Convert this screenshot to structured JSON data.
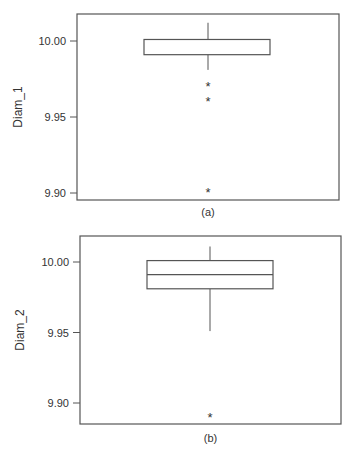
{
  "chart_data": [
    {
      "type": "box",
      "title": "",
      "caption": "(a)",
      "xlabel": "",
      "ylabel": "Diam_1",
      "ylim": [
        9.893,
        10.016
      ],
      "yticks": [
        9.9,
        9.95,
        10.0
      ],
      "ytick_labels": [
        "9.90",
        "9.95",
        "10.00"
      ],
      "grid": false,
      "box": {
        "whisker_low": 9.981,
        "q1": 9.991,
        "median": 9.991,
        "q3": 10.001,
        "whisker_high": 10.012
      },
      "outliers": [
        9.971,
        9.961,
        9.901
      ],
      "outlier_marker": "*"
    },
    {
      "type": "box",
      "title": "",
      "caption": "(b)",
      "xlabel": "",
      "ylabel": "Diam_2",
      "ylim": [
        9.883,
        10.018
      ],
      "yticks": [
        9.9,
        9.95,
        10.0
      ],
      "ytick_labels": [
        "9.90",
        "9.95",
        "10.00"
      ],
      "grid": false,
      "box": {
        "whisker_low": 9.951,
        "q1": 9.981,
        "median": 9.991,
        "q3": 10.001,
        "whisker_high": 10.011
      },
      "outliers": [
        9.891
      ],
      "outlier_marker": "*"
    }
  ],
  "colors": {
    "frame": "#555555",
    "box": "#555555",
    "text": "#333333",
    "background": "#ffffff"
  }
}
